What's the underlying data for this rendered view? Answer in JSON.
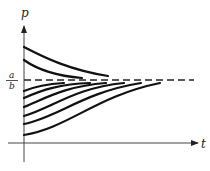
{
  "diagram": {
    "y_axis_label": "p",
    "x_axis_label": "t",
    "asymptote_label_numerator": "a",
    "asymptote_label_denominator": "b",
    "asymptote_style": "dashed",
    "curves_above": [
      {
        "name": "upper-curve-1",
        "start_relative": "highest",
        "trend": "decreasing"
      },
      {
        "name": "upper-curve-2",
        "start_relative": "above",
        "trend": "decreasing"
      }
    ],
    "curves_below": [
      {
        "name": "lower-curve-1",
        "trend": "increasing"
      },
      {
        "name": "lower-curve-2",
        "trend": "increasing"
      },
      {
        "name": "lower-curve-3",
        "trend": "increasing"
      },
      {
        "name": "lower-curve-4",
        "trend": "increasing"
      },
      {
        "name": "lower-curve-5",
        "trend": "increasing"
      },
      {
        "name": "lower-curve-6",
        "trend": "increasing"
      }
    ],
    "colors": {
      "ink": "#111111",
      "axis": "#444444",
      "background": "#ffffff"
    }
  }
}
